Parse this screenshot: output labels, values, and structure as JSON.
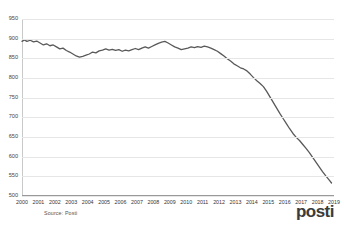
{
  "header": {
    "clipped_text": "",
    "note": ""
  },
  "footer": {
    "source_label": "Source: Posti",
    "logo_text": "posti"
  },
  "colors": {
    "line": "#595959",
    "grid": "#e6e6e6",
    "axis": "#9a9a9a",
    "logo": "#3b3b3b",
    "logo_accent": "#d43d3d",
    "background": "#ffffff"
  },
  "chart_data": {
    "type": "line",
    "title": "",
    "subtitle": "",
    "xlabel": "",
    "ylabel": "",
    "xlim": [
      2000,
      2019
    ],
    "ylim": [
      500,
      950
    ],
    "grid": true,
    "legend": false,
    "yticks": [
      500,
      550,
      600,
      650,
      700,
      750,
      800,
      850,
      900,
      950
    ],
    "xticks": [
      2000,
      2001,
      2002,
      2003,
      2004,
      2005,
      2006,
      2007,
      2008,
      2009,
      2010,
      2011,
      2012,
      2013,
      2014,
      2015,
      2016,
      2017,
      2018,
      2019
    ],
    "series": [
      {
        "name": "Volume",
        "color": "#595959",
        "points": [
          [
            2000.0,
            893
          ],
          [
            2000.15,
            897
          ],
          [
            2000.3,
            893
          ],
          [
            2000.5,
            896
          ],
          [
            2000.7,
            892
          ],
          [
            2000.9,
            894
          ],
          [
            2001.1,
            889
          ],
          [
            2001.3,
            884
          ],
          [
            2001.5,
            887
          ],
          [
            2001.7,
            882
          ],
          [
            2001.9,
            884
          ],
          [
            2002.1,
            879
          ],
          [
            2002.3,
            874
          ],
          [
            2002.5,
            876
          ],
          [
            2002.7,
            870
          ],
          [
            2002.9,
            866
          ],
          [
            2003.1,
            861
          ],
          [
            2003.3,
            856
          ],
          [
            2003.5,
            853
          ],
          [
            2003.7,
            855
          ],
          [
            2003.9,
            858
          ],
          [
            2004.1,
            861
          ],
          [
            2004.3,
            866
          ],
          [
            2004.5,
            864
          ],
          [
            2004.7,
            869
          ],
          [
            2004.9,
            871
          ],
          [
            2005.1,
            874
          ],
          [
            2005.3,
            871
          ],
          [
            2005.5,
            873
          ],
          [
            2005.7,
            870
          ],
          [
            2005.9,
            872
          ],
          [
            2006.1,
            868
          ],
          [
            2006.3,
            871
          ],
          [
            2006.5,
            869
          ],
          [
            2006.7,
            872
          ],
          [
            2006.9,
            875
          ],
          [
            2007.1,
            872
          ],
          [
            2007.3,
            876
          ],
          [
            2007.5,
            879
          ],
          [
            2007.7,
            876
          ],
          [
            2007.9,
            880
          ],
          [
            2008.1,
            884
          ],
          [
            2008.3,
            888
          ],
          [
            2008.5,
            891
          ],
          [
            2008.7,
            893
          ],
          [
            2008.9,
            889
          ],
          [
            2009.1,
            884
          ],
          [
            2009.3,
            879
          ],
          [
            2009.5,
            876
          ],
          [
            2009.7,
            872
          ],
          [
            2009.9,
            874
          ],
          [
            2010.1,
            876
          ],
          [
            2010.3,
            879
          ],
          [
            2010.5,
            877
          ],
          [
            2010.7,
            880
          ],
          [
            2010.9,
            878
          ],
          [
            2011.1,
            881
          ],
          [
            2011.3,
            879
          ],
          [
            2011.5,
            876
          ],
          [
            2011.7,
            872
          ],
          [
            2011.9,
            868
          ],
          [
            2012.1,
            862
          ],
          [
            2012.3,
            856
          ],
          [
            2012.5,
            849
          ],
          [
            2012.7,
            843
          ],
          [
            2012.9,
            836
          ],
          [
            2013.1,
            831
          ],
          [
            2013.3,
            826
          ],
          [
            2013.5,
            823
          ],
          [
            2013.7,
            818
          ],
          [
            2013.9,
            810
          ],
          [
            2014.1,
            801
          ],
          [
            2014.3,
            793
          ],
          [
            2014.5,
            786
          ],
          [
            2014.7,
            778
          ],
          [
            2014.9,
            766
          ],
          [
            2015.1,
            752
          ],
          [
            2015.3,
            738
          ],
          [
            2015.5,
            724
          ],
          [
            2015.7,
            710
          ],
          [
            2015.9,
            697
          ],
          [
            2016.1,
            684
          ],
          [
            2016.3,
            671
          ],
          [
            2016.5,
            659
          ],
          [
            2016.7,
            649
          ],
          [
            2016.9,
            641
          ],
          [
            2017.1,
            631
          ],
          [
            2017.3,
            621
          ],
          [
            2017.5,
            610
          ],
          [
            2017.7,
            598
          ],
          [
            2017.9,
            586
          ],
          [
            2018.1,
            574
          ],
          [
            2018.3,
            562
          ],
          [
            2018.5,
            551
          ],
          [
            2018.7,
            541
          ],
          [
            2018.85,
            533
          ]
        ]
      }
    ]
  }
}
